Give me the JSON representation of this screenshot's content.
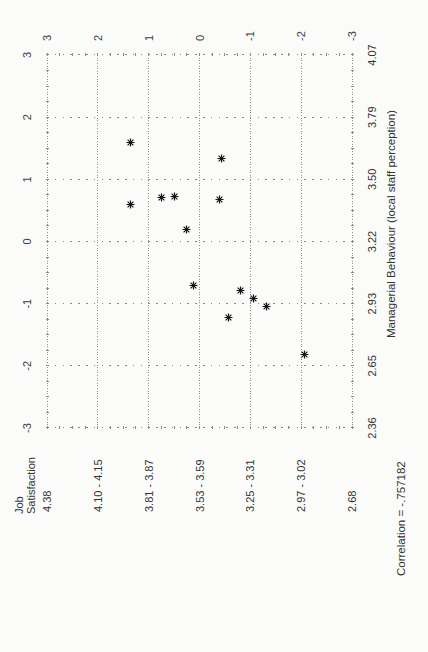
{
  "chart_data": {
    "type": "scatter",
    "title": "",
    "xlabel": "Managerial Behaviour (local staff perception)",
    "ylabel": "Job Satisfaction",
    "caption": "Correlation = -.757182",
    "xlim": [
      -3,
      3
    ],
    "ylim": [
      -3,
      3
    ],
    "grid": "dotted",
    "marker": "asterisk",
    "page_orientation": "chart rotated 90 degrees counter-clockwise on portrait page",
    "std_ticks": [
      3,
      2,
      1,
      0,
      -1,
      -2,
      -3
    ],
    "bottom_axis": {
      "label": "Managerial Behaviour (local staff perception)",
      "value_labels": [
        "2.36",
        "2.65",
        "2.93",
        "3.22",
        "3.50",
        "3.79",
        "4.07"
      ]
    },
    "left_axis": {
      "label_lines": [
        "Job",
        "Satisfaction"
      ],
      "value_labels_top_to_bottom": [
        "4.38",
        "4.10 - 4.15",
        "3.81 - 3.87",
        "3.53 - 3.59",
        "3.25 - 3.31",
        "2.97 - 3.02",
        "2.68"
      ]
    },
    "points_std": [
      {
        "x": 1.6,
        "y": 1.46
      },
      {
        "x": 0.59,
        "y": 1.46
      },
      {
        "x": 0.7,
        "y": 0.85
      },
      {
        "x": 0.72,
        "y": 0.6
      },
      {
        "x": 0.19,
        "y": 0.36
      },
      {
        "x": -0.7,
        "y": 0.22
      },
      {
        "x": 0.67,
        "y": -0.29
      },
      {
        "x": 1.33,
        "y": -0.33
      },
      {
        "x": -0.79,
        "y": -0.7
      },
      {
        "x": -0.92,
        "y": -0.96
      },
      {
        "x": -1.04,
        "y": -1.21
      },
      {
        "x": -1.23,
        "y": -0.48
      },
      {
        "x": -1.81,
        "y": -1.96
      }
    ],
    "colors": {
      "background": "#fbfbf9",
      "marker": "#161616",
      "grid_dots": "#8f8f8f",
      "text": "#383838"
    }
  }
}
